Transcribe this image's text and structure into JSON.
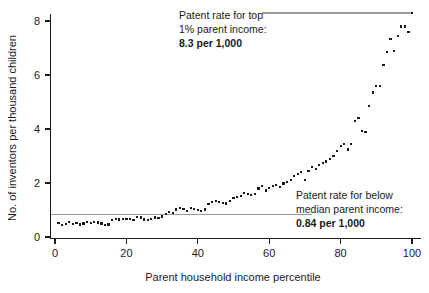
{
  "chart_data": {
    "type": "scatter",
    "title": "",
    "xlabel": "Parent household income percentile",
    "ylabel": "No. of inventors per thousand children",
    "xlim": [
      0,
      100
    ],
    "ylim": [
      0,
      8.8
    ],
    "grid": false,
    "legend": "none",
    "xticks": [
      "0",
      "20",
      "40",
      "60",
      "80",
      "100"
    ],
    "xtick_values": [
      0,
      20,
      40,
      60,
      80,
      100
    ],
    "yticks": [
      "0",
      "2",
      "4",
      "6",
      "8"
    ],
    "ytick_values": [
      0,
      2,
      4,
      6,
      8
    ],
    "marker": "square-dot",
    "marker_color": "#1a1a1a",
    "x": [
      1,
      2,
      3,
      4,
      5,
      6,
      7,
      8,
      9,
      10,
      11,
      12,
      13,
      14,
      15,
      16,
      17,
      18,
      19,
      20,
      21,
      22,
      23,
      24,
      25,
      26,
      27,
      28,
      29,
      30,
      31,
      32,
      33,
      34,
      35,
      36,
      37,
      38,
      39,
      40,
      41,
      42,
      43,
      44,
      45,
      46,
      47,
      48,
      49,
      50,
      51,
      52,
      53,
      54,
      55,
      56,
      57,
      58,
      59,
      60,
      61,
      62,
      63,
      64,
      65,
      66,
      67,
      68,
      69,
      70,
      71,
      72,
      73,
      74,
      75,
      76,
      77,
      78,
      79,
      80,
      81,
      82,
      83,
      84,
      85,
      86,
      87,
      88,
      89,
      90,
      91,
      92,
      93,
      94,
      95,
      96,
      97,
      98,
      99,
      100
    ],
    "y": [
      0.52,
      0.44,
      0.48,
      0.55,
      0.49,
      0.52,
      0.46,
      0.5,
      0.56,
      0.53,
      0.57,
      0.54,
      0.5,
      0.44,
      0.46,
      0.63,
      0.66,
      0.65,
      0.67,
      0.66,
      0.68,
      0.63,
      0.73,
      0.72,
      0.65,
      0.63,
      0.66,
      0.72,
      0.7,
      0.76,
      0.86,
      0.92,
      0.88,
      1.02,
      1.08,
      1.05,
      0.95,
      1.06,
      1.04,
      1.0,
      0.95,
      1.02,
      1.22,
      1.3,
      1.33,
      1.3,
      1.26,
      1.24,
      1.33,
      1.44,
      1.48,
      1.52,
      1.63,
      1.6,
      1.55,
      1.6,
      1.8,
      1.9,
      1.72,
      1.82,
      1.88,
      1.92,
      1.86,
      1.98,
      2.04,
      2.12,
      2.26,
      2.32,
      2.4,
      2.1,
      2.44,
      2.6,
      2.52,
      2.66,
      2.74,
      2.8,
      2.88,
      3.0,
      3.18,
      3.36,
      3.44,
      3.24,
      3.45,
      4.3,
      4.42,
      3.92,
      3.88,
      4.85,
      5.35,
      5.6,
      5.6,
      6.38,
      6.86,
      7.32,
      6.9,
      7.44,
      7.8,
      7.8,
      7.6,
      8.3
    ]
  },
  "annotations": {
    "top": {
      "line1": "Patent rate for top",
      "line2": "1% parent income:",
      "value": "8.3 per 1,000",
      "ref_value": 8.3,
      "ref_color": "#9a9a9a"
    },
    "bottom": {
      "line1": "Patent rate for below",
      "line2": "median parent income:",
      "value": "0.84 per 1,000",
      "ref_value": 0.84,
      "ref_color": "#9a9a9a"
    }
  }
}
